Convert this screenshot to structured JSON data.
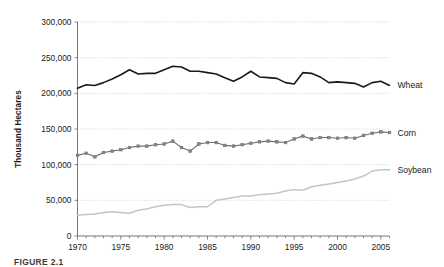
{
  "figure": {
    "caption": "FIGURE 2.1",
    "background_color": "#ffffff"
  },
  "chart_data": {
    "type": "line",
    "title": "",
    "xlabel": "",
    "ylabel": "Thousand Hectares",
    "xlim": [
      1970,
      2006
    ],
    "ylim": [
      0,
      300000
    ],
    "ytick_values": [
      0,
      50000,
      100000,
      150000,
      200000,
      250000,
      300000
    ],
    "ytick_labels": [
      "0",
      "50,000",
      "100,000",
      "150,000",
      "200,000",
      "250,000",
      "300,000"
    ],
    "xtick_values": [
      1970,
      1975,
      1980,
      1985,
      1990,
      1995,
      2000,
      2005
    ],
    "xtick_labels": [
      "1970",
      "1975",
      "1980",
      "1985",
      "1990",
      "1995",
      "2000",
      "2005"
    ],
    "x_minor_ticks_every": 1,
    "grid": true,
    "grid_axis": "y",
    "grid_color": "#b9b9b9",
    "legend_position": "right-inline",
    "x": [
      1970,
      1971,
      1972,
      1973,
      1974,
      1975,
      1976,
      1977,
      1978,
      1979,
      1980,
      1981,
      1982,
      1983,
      1984,
      1985,
      1986,
      1987,
      1988,
      1989,
      1990,
      1991,
      1992,
      1993,
      1994,
      1995,
      1996,
      1997,
      1998,
      1999,
      2000,
      2001,
      2002,
      2003,
      2004,
      2005,
      2006
    ],
    "series": [
      {
        "name": "Wheat",
        "label": "Wheat",
        "color": "#1a1a1a",
        "line_width": 1.6,
        "marker": "none",
        "values": [
          207000,
          212000,
          211000,
          215000,
          220000,
          226000,
          233000,
          227000,
          228000,
          228000,
          233000,
          238000,
          237000,
          231000,
          231000,
          229000,
          227000,
          222000,
          217000,
          223000,
          231000,
          223000,
          222000,
          221000,
          215000,
          213000,
          229000,
          228000,
          223000,
          215000,
          216000,
          215000,
          214000,
          209000,
          215000,
          217000,
          211000
        ]
      },
      {
        "name": "Corn",
        "label": "Corn",
        "color": "#6e6e6e",
        "line_width": 1.1,
        "marker": "square",
        "marker_size": 2.6,
        "values": [
          113000,
          116000,
          111000,
          117000,
          119000,
          121000,
          124000,
          126000,
          126000,
          128000,
          129000,
          133000,
          124000,
          119000,
          129000,
          131000,
          131000,
          127000,
          126000,
          128000,
          130000,
          132000,
          133000,
          132000,
          131000,
          136000,
          140000,
          136000,
          138000,
          138000,
          137000,
          138000,
          137000,
          141000,
          144000,
          146000,
          145000
        ]
      },
      {
        "name": "Soybean",
        "label": "Soybean",
        "color": "#c4c4c4",
        "line_width": 1.5,
        "marker": "none",
        "values": [
          29000,
          30000,
          31000,
          33000,
          34000,
          33000,
          32000,
          36000,
          38000,
          41000,
          43000,
          44000,
          44000,
          40000,
          41000,
          41000,
          50000,
          52000,
          54000,
          56000,
          56000,
          58000,
          59000,
          60000,
          63000,
          65000,
          64000,
          69000,
          71000,
          73000,
          75000,
          77000,
          80000,
          84000,
          91000,
          93000,
          93000
        ]
      }
    ]
  }
}
